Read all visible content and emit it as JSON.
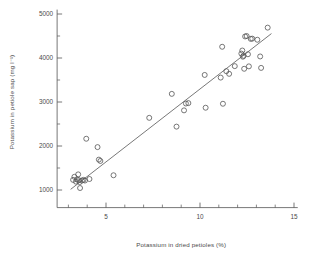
{
  "figure": {
    "background": "#ffffff",
    "ink": "#555555",
    "marker_color": "#555555",
    "line_color": "#555555"
  },
  "chart_data": {
    "type": "scatter",
    "title": "",
    "xlabel": "Potassium in dried petioles (%)",
    "ylabel": "Potassium in petiole sap (mg l⁻¹)",
    "xlim": [
      2.4,
      15.2
    ],
    "ylim": [
      600,
      5100
    ],
    "xticks": [
      5,
      10,
      15
    ],
    "xtick_labels": [
      "5",
      "10",
      "15"
    ],
    "xminor": [
      3,
      4,
      6,
      7,
      8,
      9,
      11,
      12,
      13,
      14
    ],
    "yticks": [
      1000,
      2000,
      3000,
      4000,
      5000
    ],
    "ytick_labels": [
      "1000",
      "2000",
      "3000",
      "4000",
      "5000"
    ],
    "yminor": [
      1500,
      2500,
      3500,
      4500
    ],
    "grid": false,
    "legend": null,
    "marker": "open-circle",
    "points": [
      [
        3.25,
        1230
      ],
      [
        3.32,
        1300
      ],
      [
        3.4,
        1190
      ],
      [
        3.45,
        1240
      ],
      [
        3.52,
        1355
      ],
      [
        3.55,
        1225
      ],
      [
        3.6,
        1180
      ],
      [
        3.62,
        1045
      ],
      [
        3.72,
        1215
      ],
      [
        3.8,
        1230
      ],
      [
        3.88,
        1215
      ],
      [
        3.95,
        2165
      ],
      [
        4.12,
        1250
      ],
      [
        4.55,
        1975
      ],
      [
        4.62,
        1690
      ],
      [
        4.7,
        1660
      ],
      [
        5.4,
        1335
      ],
      [
        7.3,
        2640
      ],
      [
        8.5,
        3185
      ],
      [
        8.75,
        2440
      ],
      [
        9.15,
        2810
      ],
      [
        9.25,
        2965
      ],
      [
        9.38,
        2975
      ],
      [
        10.25,
        3615
      ],
      [
        10.3,
        2870
      ],
      [
        11.1,
        3555
      ],
      [
        11.18,
        4255
      ],
      [
        11.22,
        2960
      ],
      [
        11.4,
        3700
      ],
      [
        11.55,
        3640
      ],
      [
        11.85,
        3815
      ],
      [
        12.2,
        4100
      ],
      [
        12.25,
        4170
      ],
      [
        12.28,
        4030
      ],
      [
        12.32,
        4050
      ],
      [
        12.35,
        3755
      ],
      [
        12.4,
        4490
      ],
      [
        12.48,
        4500
      ],
      [
        12.55,
        4085
      ],
      [
        12.6,
        3810
      ],
      [
        12.7,
        4435
      ],
      [
        12.78,
        4440
      ],
      [
        13.05,
        4415
      ],
      [
        13.2,
        4035
      ],
      [
        13.25,
        3775
      ],
      [
        13.6,
        4690
      ]
    ],
    "fit_line": {
      "type": "linear",
      "x_start": 3.12,
      "y_start": 1015,
      "x_end": 13.8,
      "y_end": 4555
    }
  }
}
